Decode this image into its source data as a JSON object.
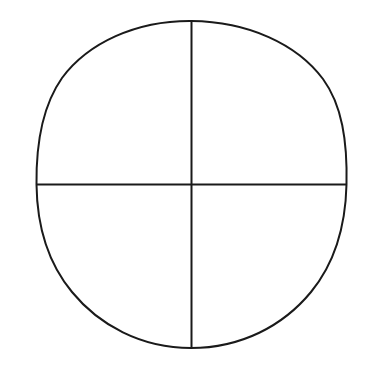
{
  "document": {
    "title": "Circle Divided Into Quadrants",
    "background_color": "#ffffff",
    "width": 369,
    "height": 371
  },
  "diagram": {
    "name": "quadrant-circle",
    "stroke_color": "#1a1a1a",
    "stroke_width": 2,
    "fill_color": "none",
    "circle": {
      "label": "circle-outline",
      "center_x": 191.5,
      "center_y": 184.5,
      "radius_x": 155,
      "radius_y": 163.5,
      "left_extremity_x": 36.5,
      "right_extremity_x": 346.5,
      "top_extremity_y": 21,
      "bottom_extremity_y": 348
    },
    "vertical_diameter": {
      "label": "vertical-diameter",
      "x": 191.5,
      "y_start": 21,
      "y_end": 348
    },
    "horizontal_diameter": {
      "label": "horizontal-diameter",
      "y": 184.5,
      "x_start": 36.5,
      "x_end": 346.5
    },
    "quadrants": [
      {
        "name": "upper-left-quadrant",
        "position": "top-left"
      },
      {
        "name": "upper-right-quadrant",
        "position": "top-right"
      },
      {
        "name": "lower-left-quadrant",
        "position": "bottom-left"
      },
      {
        "name": "lower-right-quadrant",
        "position": "bottom-right"
      }
    ]
  }
}
